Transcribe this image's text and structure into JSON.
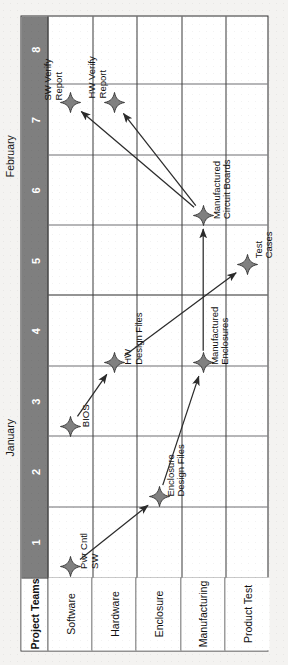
{
  "chart_data": {
    "type": "table",
    "xlabel": "Week",
    "ylabel": "Project Teams",
    "corner_header": "Project Teams",
    "grid": true,
    "months": [
      {
        "name": "January",
        "weeks": [
          1,
          2,
          3,
          4
        ]
      },
      {
        "name": "February",
        "weeks": [
          5,
          6,
          7,
          8
        ]
      }
    ],
    "week_ticks": [
      "1",
      "2",
      "3",
      "4",
      "5",
      "6",
      "7",
      "8"
    ],
    "rows": [
      "Software",
      "Hardware",
      "Enclosure",
      "Manufacturing",
      "Product Test"
    ],
    "milestones": [
      {
        "id": "pwr-cntl-sw",
        "label": "Pwr Cntl\nSW",
        "row": "Software",
        "week": 1.15
      },
      {
        "id": "bios",
        "label": "BIOS",
        "row": "Software",
        "week": 3.15
      },
      {
        "id": "sw-verify-report",
        "label": "SW Verify\nReport",
        "row": "Software",
        "week": 7.75
      },
      {
        "id": "hw-design-files",
        "label": "HW\nDesign Files",
        "row": "Hardware",
        "week": 4.05
      },
      {
        "id": "hw-verify-report",
        "label": "HW Verify\nReport",
        "row": "Hardware",
        "week": 7.75
      },
      {
        "id": "enclosure-design-files",
        "label": "Enclosure\nDesign Files",
        "row": "Enclosure",
        "week": 2.15
      },
      {
        "id": "manufactured-enclosures",
        "label": "Manufactured\nEnclosures",
        "row": "Manufacturing",
        "week": 4.05
      },
      {
        "id": "manufactured-circuit-boards",
        "label": "Manufactured\nCircuit Boards",
        "row": "Manufacturing",
        "week": 6.15
      },
      {
        "id": "test-cases",
        "label": "Test\nCases",
        "row": "Product Test",
        "week": 5.45
      }
    ],
    "dependencies": [
      {
        "from": "pwr-cntl-sw",
        "to": "enclosure-design-files"
      },
      {
        "from": "bios",
        "to": "hw-design-files"
      },
      {
        "from": "enclosure-design-files",
        "to": "manufactured-enclosures"
      },
      {
        "from": "hw-design-files",
        "to": "test-cases"
      },
      {
        "from": "manufactured-enclosures",
        "to": "manufactured-circuit-boards"
      },
      {
        "from": "manufactured-circuit-boards",
        "to": "sw-verify-report"
      },
      {
        "from": "manufactured-circuit-boards",
        "to": "hw-verify-report"
      }
    ],
    "colors": {
      "header_band": "#7f7f7f",
      "header_text": "#ffffff",
      "marker": "#808080",
      "marker_outline": "#2b2b2b",
      "grid_line": "#6e6e73",
      "frame": "#2b2b2b",
      "arrow": "#2b2b2b",
      "background": "#ffffff"
    }
  },
  "labels": {
    "corner_header": "Project Teams",
    "month_january": "January",
    "month_february": "February",
    "rows": {
      "software": "Software",
      "hardware": "Hardware",
      "enclosure": "Enclosure",
      "manufacturing": "Manufacturing",
      "product_test": "Product Test"
    },
    "weeks": {
      "w1": "1",
      "w2": "2",
      "w3": "3",
      "w4": "4",
      "w5": "5",
      "w6": "6",
      "w7": "7",
      "w8": "8"
    },
    "milestones": {
      "pwr_cntl_sw": "Pwr Cntl\nSW",
      "bios": "BIOS",
      "sw_verify_report": "SW Verify\nReport",
      "hw_design_files": "HW\nDesign Files",
      "hw_verify_report": "HW Verify\nReport",
      "enclosure_design_files": "Enclosure\nDesign Files",
      "manufactured_enclosures": "Manufactured\nEnclosures",
      "manufactured_circuit_boards": "Manufactured\nCircuit Boards",
      "test_cases": "Test\nCases"
    }
  }
}
